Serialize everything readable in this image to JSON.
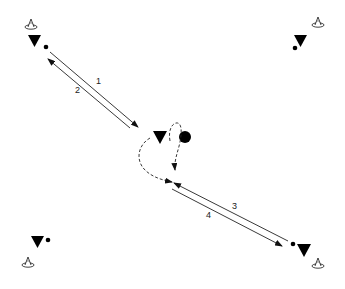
{
  "diagram": {
    "type": "drill-diagram",
    "colors": {
      "ink": "#000000",
      "line": "#222222",
      "background": "#ffffff"
    },
    "passes": [
      {
        "label": "1",
        "from": "top-left",
        "to": "center",
        "style": "solid"
      },
      {
        "label": "2",
        "from": "center",
        "to": "top-left",
        "style": "solid"
      },
      {
        "label": "3",
        "from": "bottom-right",
        "to": "center",
        "style": "solid"
      },
      {
        "label": "4",
        "from": "center",
        "to": "bottom-right",
        "style": "solid"
      }
    ],
    "movements": [
      {
        "name": "center-player-run",
        "style": "dashed"
      },
      {
        "name": "ball-dribble",
        "style": "dashed"
      }
    ],
    "players": [
      "top-left",
      "top-right",
      "center",
      "bottom-left",
      "bottom-right"
    ],
    "cones": [
      "top-left",
      "top-right",
      "bottom-left",
      "bottom-right"
    ]
  }
}
